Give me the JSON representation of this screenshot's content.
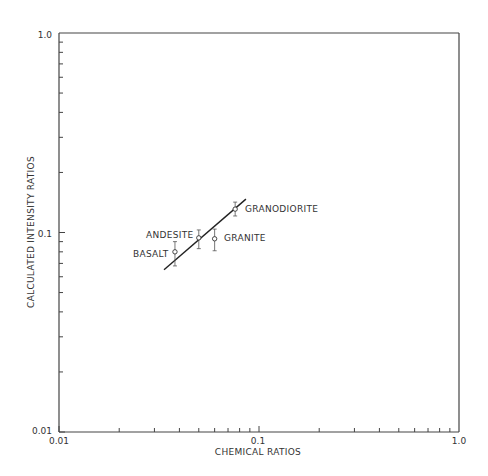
{
  "chart_data": {
    "type": "scatter",
    "title": "",
    "xlabel": "CHEMICAL RATIOS",
    "ylabel": "CALCULATED INTENSITY RATIOS",
    "xscale": "log",
    "yscale": "log",
    "xlim": [
      0.01,
      1.0
    ],
    "ylim": [
      0.01,
      1.0
    ],
    "x_tick_labels": [
      "0.01",
      "0.1",
      "1.0"
    ],
    "y_tick_labels": [
      "0.01",
      "0.1",
      "1.0"
    ],
    "grid": false,
    "legend": null,
    "points": [
      {
        "label": "BASALT",
        "x": 0.038,
        "y": 0.08,
        "y_err_low": 0.068,
        "y_err_high": 0.09
      },
      {
        "label": "ANDESITE",
        "x": 0.05,
        "y": 0.094,
        "y_err_low": 0.083,
        "y_err_high": 0.103
      },
      {
        "label": "GRANITE",
        "x": 0.06,
        "y": 0.093,
        "y_err_low": 0.081,
        "y_err_high": 0.104
      },
      {
        "label": "GRANODIORITE",
        "x": 0.076,
        "y": 0.131,
        "y_err_low": 0.121,
        "y_err_high": 0.142
      }
    ],
    "fit_line": {
      "x": [
        0.0335,
        0.086
      ],
      "y": [
        0.065,
        0.147
      ]
    }
  },
  "axes": {
    "x_title": "CHEMICAL RATIOS",
    "y_title": "CALCULATED INTENSITY RATIOS",
    "x_ticks": {
      "min": "0.01",
      "mid": "0.1",
      "max": "1.0"
    },
    "y_ticks": {
      "min": "0.01",
      "mid": "0.1",
      "max": "1.0"
    }
  },
  "labels": {
    "basalt": "BASALT",
    "andesite": "ANDESITE",
    "granite": "GRANITE",
    "granodiorite": "GRANODIORITE"
  }
}
